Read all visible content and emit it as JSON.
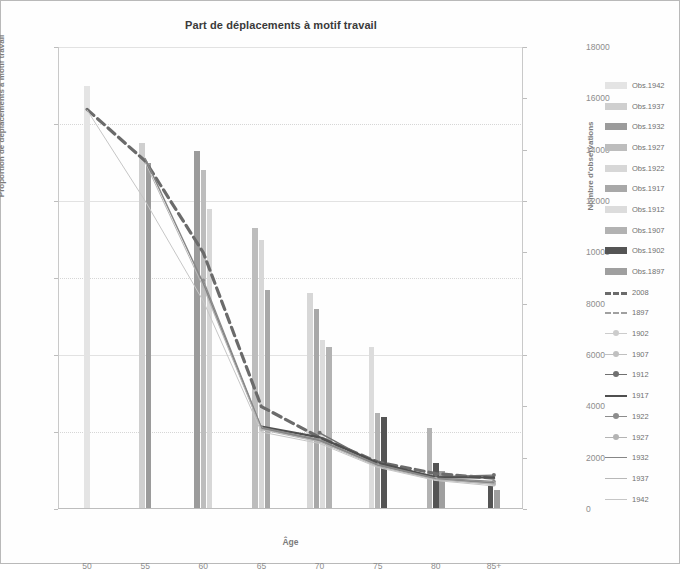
{
  "chart_data": {
    "type": "bar",
    "title": "Part de déplacements à motif travail",
    "xlabel": "Âge",
    "ylabel": "Proportion de déplacements à motif travail",
    "ylabel_right": "Nombre d'observations",
    "categories": [
      "50",
      "55",
      "60",
      "65",
      "70",
      "75",
      "80",
      "85+"
    ],
    "ylim": [
      0,
      0.6
    ],
    "yticks": [
      "0%",
      "10%",
      "20%",
      "30%",
      "40%",
      "50%",
      "60%"
    ],
    "ytick_values": [
      0,
      0.1,
      0.2,
      0.3,
      0.4,
      0.5,
      0.6
    ],
    "ylim_right": [
      0,
      18000
    ],
    "yticks_right": [
      "0",
      "2000",
      "4000",
      "6000",
      "8000",
      "10000",
      "12000",
      "14000",
      "16000",
      "18000"
    ],
    "ytick_values_right": [
      0,
      2000,
      4000,
      6000,
      8000,
      10000,
      12000,
      14000,
      16000,
      18000
    ],
    "grid": true,
    "legend_position": "right",
    "bar_series": [
      {
        "name": "Obs.1942",
        "color": "#e4e4e4",
        "values": [
          16500,
          null,
          null,
          null,
          null,
          null,
          null,
          null
        ]
      },
      {
        "name": "Obs.1937",
        "color": "#cfcfcf",
        "values": [
          null,
          14250,
          null,
          null,
          null,
          null,
          null,
          null
        ]
      },
      {
        "name": "Obs.1932",
        "color": "#9b9b9b",
        "values": [
          null,
          13500,
          13950,
          null,
          null,
          null,
          null,
          null
        ]
      },
      {
        "name": "Obs.1927",
        "color": "#bdbdbd",
        "values": [
          null,
          null,
          13200,
          10950,
          null,
          null,
          null,
          null
        ]
      },
      {
        "name": "Obs.1922",
        "color": "#d7d7d7",
        "values": [
          null,
          null,
          11700,
          10500,
          8400,
          null,
          null,
          null
        ]
      },
      {
        "name": "Obs.1917",
        "color": "#a8a8a8",
        "values": [
          null,
          null,
          null,
          8550,
          7800,
          null,
          null,
          null
        ]
      },
      {
        "name": "Obs.1912",
        "color": "#dcdcdc",
        "values": [
          null,
          null,
          null,
          null,
          6600,
          6300,
          null,
          null
        ]
      },
      {
        "name": "Obs.1907",
        "color": "#b2b2b2",
        "values": [
          null,
          null,
          null,
          null,
          6300,
          3750,
          3150,
          null
        ]
      },
      {
        "name": "Obs.1902",
        "color": "#545454",
        "values": [
          null,
          null,
          null,
          null,
          null,
          3600,
          1800,
          900
        ]
      },
      {
        "name": "Obs.1897",
        "color": "#9f9f9f",
        "values": [
          null,
          null,
          null,
          null,
          null,
          null,
          1500,
          750
        ]
      }
    ],
    "line_series": [
      {
        "name": "2008",
        "style": "thick-dash",
        "color": "#6b6b6b",
        "values": [
          0.519,
          0.452,
          0.333,
          0.133,
          0.093,
          0.061,
          0.046,
          0.04
        ]
      },
      {
        "name": "1897",
        "style": "dash",
        "color": "#a0a0a0",
        "values": [
          null,
          null,
          null,
          null,
          null,
          null,
          null,
          null
        ]
      },
      {
        "name": "1902",
        "style": "marker-light",
        "color": "#cccccc",
        "values": [
          null,
          null,
          null,
          null,
          null,
          null,
          0.041,
          0.034
        ]
      },
      {
        "name": "1907",
        "style": "marker-light",
        "color": "#c0c0c0",
        "values": [
          null,
          null,
          null,
          null,
          null,
          0.057,
          0.039,
          0.032
        ]
      },
      {
        "name": "1912",
        "style": "marker-dark",
        "color": "#707070",
        "values": [
          null,
          null,
          null,
          null,
          0.099,
          0.058,
          0.042,
          0.044
        ]
      },
      {
        "name": "1917",
        "style": "thick-solid",
        "color": "#4f4f4f",
        "values": [
          null,
          null,
          null,
          0.107,
          0.093,
          0.06,
          0.041,
          0.041
        ]
      },
      {
        "name": "1922",
        "style": "marker-mid",
        "color": "#8c8c8c",
        "values": [
          null,
          null,
          0.297,
          0.106,
          0.09,
          0.058,
          0.04,
          0.036
        ]
      },
      {
        "name": "1927",
        "style": "marker-light2",
        "color": "#b4b4b4",
        "values": [
          null,
          null,
          0.29,
          0.104,
          0.088,
          0.056,
          0.039,
          0.033
        ]
      },
      {
        "name": "1932",
        "style": "solid-mid",
        "color": "#868686",
        "values": [
          null,
          0.455,
          0.293,
          0.105,
          0.089,
          0.057,
          0.039,
          0.034
        ]
      },
      {
        "name": "1937",
        "style": "thin-solid",
        "color": "#b8b8b8",
        "values": [
          null,
          0.45,
          0.288,
          0.103,
          0.087,
          0.055,
          0.038,
          0.032
        ]
      },
      {
        "name": "1942",
        "style": "thin-solid2",
        "color": "#c6c6c6",
        "values": [
          0.518,
          0.4,
          0.27,
          0.1,
          0.085,
          0.054,
          0.037,
          0.03
        ]
      }
    ]
  }
}
